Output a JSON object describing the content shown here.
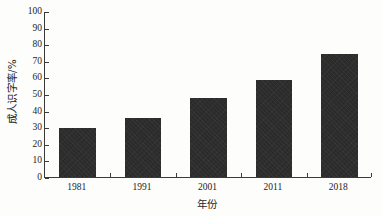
{
  "chart_data": {
    "type": "bar",
    "title": "",
    "subtitle": "",
    "categories": [
      "1981",
      "1991",
      "2001",
      "2011",
      "2018"
    ],
    "values": [
      29.5,
      35.5,
      47.5,
      58.5,
      74
    ],
    "xlabel": "年份",
    "ylabel": "成人识字率/%",
    "ylim": [
      0,
      100
    ],
    "ytick_step": 10,
    "yticks": [
      "0",
      "10",
      "20",
      "30",
      "40",
      "50",
      "60",
      "70",
      "80",
      "90",
      "100"
    ],
    "grid": false,
    "legend": null,
    "legend_position": "none",
    "annotations": [],
    "series": [
      {
        "name": "成人识字率",
        "values": [
          29.5,
          35.5,
          47.5,
          58.5,
          74
        ]
      }
    ],
    "colors": {
      "bar_fill": "#2b2b2b",
      "axis": "#3a3a3a",
      "text": "#1c1c1c",
      "background": "#fdfdfc"
    }
  }
}
